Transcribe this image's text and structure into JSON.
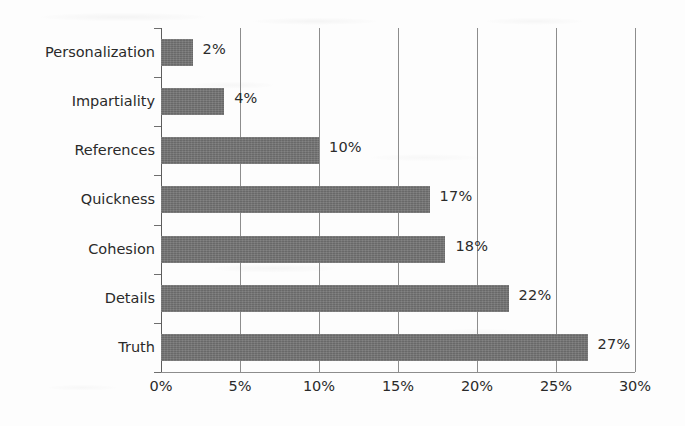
{
  "chart_data": {
    "type": "bar",
    "orientation": "horizontal",
    "title": "",
    "subtitle": "",
    "xlabel": "",
    "ylabel": "",
    "xlim": [
      0,
      30
    ],
    "xtick_labels": [
      "0%",
      "5%",
      "10%",
      "15%",
      "20%",
      "25%",
      "30%"
    ],
    "xtick_values": [
      0,
      5,
      10,
      15,
      20,
      25,
      30
    ],
    "grid": true,
    "grid_axis": "x",
    "legend": false,
    "legend_position": "none",
    "categories": [
      "Personalization",
      "Impartiality",
      "References",
      "Quickness",
      "Cohesion",
      "Details",
      "Truth"
    ],
    "values": [
      2,
      4,
      10,
      17,
      18,
      22,
      27
    ],
    "data_labels": [
      "2%",
      "4%",
      "10%",
      "17%",
      "18%",
      "22%",
      "27%"
    ],
    "series": [
      {
        "name": "",
        "values": [
          2,
          4,
          10,
          17,
          18,
          22,
          27
        ]
      }
    ],
    "colors": {
      "bar": "#737373",
      "gridline": "#8d8d8d",
      "axis": "#5d5d5d",
      "text": "#2a2a2a",
      "background": "#fdfdfd"
    }
  }
}
